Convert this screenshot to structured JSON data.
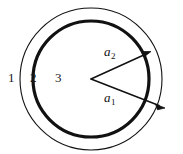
{
  "figure": {
    "background_color": "#ffffff",
    "stroke_color": "#111111",
    "width": 183,
    "height": 154,
    "center": {
      "x": 91,
      "y": 79
    },
    "circles": [
      {
        "name": "outer-circle",
        "radius": 71,
        "stroke_width": 1.1,
        "style": "thin"
      },
      {
        "name": "inner-circle",
        "radius": 58,
        "stroke_width": 3.2,
        "style": "thick"
      }
    ],
    "regions": [
      {
        "id": "region-1",
        "label": "1",
        "x": 8,
        "y": 71
      },
      {
        "id": "region-2",
        "label": "2",
        "x": 30,
        "y": 71
      },
      {
        "id": "region-3",
        "label": "3",
        "x": 55,
        "y": 71
      }
    ],
    "vectors": [
      {
        "id": "vector-a2",
        "label": "a",
        "subscript": "2",
        "from": {
          "x": 91,
          "y": 79
        },
        "to": {
          "x": 150,
          "y": 52
        },
        "terminates_at": "inner-circle",
        "label_x": 104,
        "label_y": 45
      },
      {
        "id": "vector-a1",
        "label": "a",
        "subscript": "1",
        "from": {
          "x": 91,
          "y": 79
        },
        "to": {
          "x": 164,
          "y": 108
        },
        "terminates_at": "outer-circle",
        "label_x": 104,
        "label_y": 91
      }
    ]
  }
}
